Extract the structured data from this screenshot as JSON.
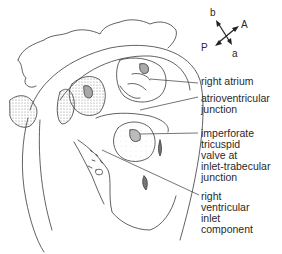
{
  "orientation": {
    "labels": {
      "b": "b",
      "A": "A",
      "P": "P",
      "a": "a"
    }
  },
  "labels": {
    "right_atrium": [
      "right atrium"
    ],
    "atrioventricular_junction": [
      "atrioventricular",
      "junction"
    ],
    "imperforate_valve": [
      "imperforate",
      "tricuspid",
      "valve at",
      "inlet-trabecular",
      "junction"
    ],
    "rv_inlet": [
      "right",
      "ventricular",
      "inlet",
      "component"
    ]
  },
  "colors": {
    "line": "#3a3a3a",
    "stipple": "#9a9a9a",
    "background": "#ffffff"
  }
}
